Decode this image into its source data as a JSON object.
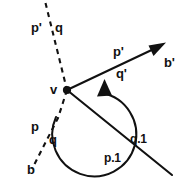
{
  "figure": {
    "type": "geometry-line-diagram",
    "background_color": "#ffffff",
    "ink_color": "#111111",
    "width": 184,
    "height": 184,
    "vertex": {
      "label": "v",
      "x": 67,
      "y": 90
    },
    "labels": {
      "top_left_p_prime": "p'",
      "top_left_q": "q",
      "upper_ray_p_prime": "p'",
      "upper_ray_q_prime": "q'",
      "upper_ray_end_b_prime": "b'",
      "lower_left_p": "p",
      "lower_left_q": "q",
      "lower_left_end_b": "b",
      "lower_right_q1": "q.1",
      "lower_right_p1": "p.1",
      "vertex": "v"
    },
    "elements": [
      {
        "name": "dashed-line-b",
        "style": "dashed",
        "from": [
          45,
          3
        ],
        "to": [
          32,
          170
        ],
        "passes_through_vertex": true
      },
      {
        "name": "ray-b-prime",
        "style": "solid",
        "arrowhead": "end",
        "from": [
          67,
          90
        ],
        "to": [
          162,
          45
        ]
      },
      {
        "name": "line-p1-q1",
        "style": "solid",
        "arrowhead": "none",
        "from": [
          67,
          90
        ],
        "to": [
          172,
          175
        ]
      },
      {
        "name": "angle-arc",
        "style": "solid",
        "arrowhead": "end",
        "direction": "counterclockwise",
        "radius": 42
      }
    ]
  }
}
